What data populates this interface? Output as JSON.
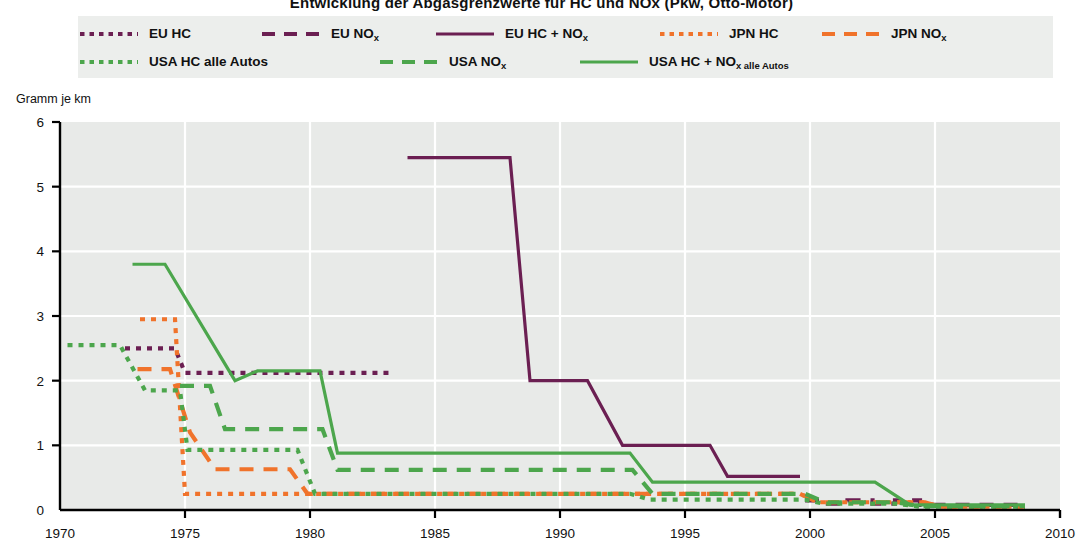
{
  "title": "Entwicklung der Abgasgrenzwerte fur HC und NOx (Pkw, Otto-Motor)",
  "yaxis": {
    "title": "Gramm je km",
    "ticks": [
      "0",
      "1",
      "2",
      "3",
      "4",
      "5",
      "6"
    ],
    "min": 0,
    "max": 6
  },
  "xaxis": {
    "ticks": [
      "1970",
      "1975",
      "1980",
      "1985",
      "1990",
      "1995",
      "2000",
      "2005",
      "2010"
    ],
    "min": 1970,
    "max": 2010
  },
  "colors": {
    "eu": "#6B1F52",
    "jpn": "#F0732B",
    "usa": "#4CA64C",
    "plot_bg": "#E8EAE8",
    "legend_bg": "#ECEEEC",
    "grid": "#FFFFFF",
    "axis": "#000000"
  },
  "legend": {
    "row1": [
      {
        "name": "eu-hc",
        "label": "EU HC",
        "sub": "",
        "color_key": "eu",
        "style": "dotted"
      },
      {
        "name": "eu-nox",
        "label": "EU NO",
        "sub": "x",
        "color_key": "eu",
        "style": "dashed"
      },
      {
        "name": "eu-hc-nox",
        "label": "EU HC + NO",
        "sub": "x",
        "color_key": "eu",
        "style": "solid"
      },
      {
        "name": "jpn-hc",
        "label": "JPN HC",
        "sub": "",
        "color_key": "jpn",
        "style": "dotted"
      },
      {
        "name": "jpn-nox",
        "label": "JPN NO",
        "sub": "x",
        "color_key": "jpn",
        "style": "dashed"
      }
    ],
    "row2": [
      {
        "name": "usa-hc",
        "label": "USA HC alle Autos",
        "sub": "",
        "color_key": "usa",
        "style": "dotted"
      },
      {
        "name": "usa-nox",
        "label": "USA NO",
        "sub": "x",
        "color_key": "usa",
        "style": "dashed"
      },
      {
        "name": "usa-hc-nox",
        "label": "USA HC + NO",
        "sub": "x alle Autos",
        "color_key": "usa",
        "style": "solid"
      }
    ]
  },
  "chart_data": {
    "type": "line",
    "title": "Entwicklung der Abgasgrenzwerte fur HC und NOx (Pkw, Otto-Motor)",
    "xlabel": "",
    "ylabel": "Gramm je km",
    "xlim": [
      1970,
      2010
    ],
    "ylim": [
      0,
      6
    ],
    "grid": true,
    "legend_position": "top",
    "series": [
      {
        "name": "EU HC",
        "color": "#6B1F52",
        "style": "dotted",
        "points": [
          [
            1972.6,
            2.5
          ],
          [
            1974.6,
            2.5
          ],
          [
            1975.0,
            2.12
          ],
          [
            1983.2,
            2.12
          ]
        ]
      },
      {
        "name": "EU NOx",
        "color": "#6B1F52",
        "style": "dashed",
        "points": [
          [
            1999.8,
            0.15
          ],
          [
            2000.5,
            0.15
          ],
          [
            2000.5,
            0.1
          ],
          [
            2001.5,
            0.1
          ],
          [
            2001.5,
            0.15
          ],
          [
            2002.5,
            0.15
          ],
          [
            2002.5,
            0.1
          ],
          [
            2003.4,
            0.1
          ],
          [
            2003.4,
            0.15
          ],
          [
            2004.4,
            0.15
          ],
          [
            2004.4,
            0.08
          ],
          [
            2008.6,
            0.08
          ]
        ]
      },
      {
        "name": "EU HC + NOx",
        "color": "#6B1F52",
        "style": "solid",
        "points": [
          [
            1983.9,
            5.45
          ],
          [
            1988.0,
            5.45
          ],
          [
            1988.8,
            2.0
          ],
          [
            1991.1,
            2.0
          ],
          [
            1992.5,
            1.0
          ],
          [
            1996.0,
            1.0
          ],
          [
            1996.7,
            0.52
          ],
          [
            1999.6,
            0.52
          ]
        ]
      },
      {
        "name": "JPN HC",
        "color": "#F0732B",
        "style": "dotted",
        "points": [
          [
            1973.2,
            2.95
          ],
          [
            1974.6,
            2.95
          ],
          [
            1974.8,
            1.6
          ],
          [
            1975.0,
            0.25
          ],
          [
            1999.6,
            0.25
          ],
          [
            2000.3,
            0.12
          ],
          [
            2004.6,
            0.12
          ],
          [
            2005.2,
            0.05
          ],
          [
            2008.6,
            0.05
          ]
        ]
      },
      {
        "name": "JPN NOx",
        "color": "#F0732B",
        "style": "dashed",
        "points": [
          [
            1973.1,
            2.18
          ],
          [
            1974.4,
            2.18
          ],
          [
            1975.2,
            1.2
          ],
          [
            1976.2,
            0.63
          ],
          [
            1979.2,
            0.63
          ],
          [
            1979.9,
            0.25
          ],
          [
            1999.6,
            0.25
          ],
          [
            2000.4,
            0.12
          ],
          [
            2004.6,
            0.12
          ],
          [
            2005.2,
            0.05
          ],
          [
            2008.6,
            0.05
          ]
        ]
      },
      {
        "name": "USA HC alle Autos",
        "color": "#4CA64C",
        "style": "dotted",
        "points": [
          [
            1970.3,
            2.55
          ],
          [
            1972.4,
            2.55
          ],
          [
            1973.4,
            1.85
          ],
          [
            1974.8,
            1.85
          ],
          [
            1975.1,
            0.93
          ],
          [
            1979.5,
            0.93
          ],
          [
            1980.2,
            0.25
          ],
          [
            1992.8,
            0.25
          ],
          [
            1993.6,
            0.16
          ],
          [
            1999.8,
            0.16
          ],
          [
            2000.5,
            0.1
          ],
          [
            2003.4,
            0.1
          ],
          [
            2004.4,
            0.05
          ],
          [
            2008.6,
            0.05
          ]
        ]
      },
      {
        "name": "USA NOx",
        "color": "#4CA64C",
        "style": "dashed",
        "points": [
          [
            1974.8,
            1.92
          ],
          [
            1976.0,
            1.92
          ],
          [
            1976.6,
            1.25
          ],
          [
            1980.5,
            1.25
          ],
          [
            1981.1,
            0.62
          ],
          [
            1992.9,
            0.62
          ],
          [
            1993.7,
            0.25
          ],
          [
            1999.8,
            0.25
          ],
          [
            2000.6,
            0.12
          ],
          [
            2003.4,
            0.12
          ],
          [
            2004.4,
            0.06
          ],
          [
            2008.6,
            0.06
          ]
        ]
      },
      {
        "name": "USA HC + NOx alle Autos",
        "color": "#4CA64C",
        "style": "solid",
        "points": [
          [
            1972.9,
            3.8
          ],
          [
            1974.2,
            3.8
          ],
          [
            1977.0,
            2.0
          ],
          [
            1977.9,
            2.15
          ],
          [
            1980.4,
            2.15
          ],
          [
            1981.1,
            0.88
          ],
          [
            1992.8,
            0.88
          ],
          [
            1993.7,
            0.43
          ],
          [
            2002.6,
            0.43
          ],
          [
            2004.0,
            0.08
          ],
          [
            2008.6,
            0.08
          ]
        ]
      }
    ]
  }
}
